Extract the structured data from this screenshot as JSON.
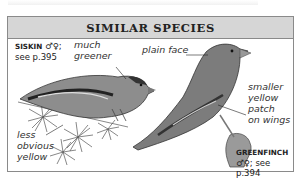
{
  "panel": {
    "title": "SIMILAR SPECIES"
  },
  "species": [
    {
      "name": "SISKIN",
      "sex_symbols": "♂♀;",
      "page_ref": "see p.395",
      "annotations": [
        "much greener",
        "less obvious yellow"
      ]
    },
    {
      "name": "GREENFINCH",
      "sex_symbols": "♂♀;",
      "page_ref": "see p.394",
      "annotations": [
        "plain face",
        "smaller yellow patch on wings"
      ]
    }
  ],
  "labels": {
    "much": "much",
    "greener": "greener",
    "less": "less",
    "obvious": "obvious",
    "yellow": "yellow",
    "plain_face": "plain face",
    "smaller": "smaller",
    "yellow2": "yellow",
    "patch": "patch",
    "on_wings": "on wings"
  }
}
